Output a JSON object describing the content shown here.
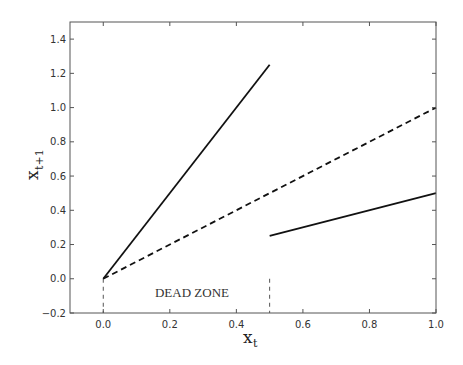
{
  "chart_data": {
    "type": "line",
    "title": "",
    "xlabel": "x_t",
    "ylabel": "x_{t+1}",
    "xlim": [
      -0.1,
      1.0
    ],
    "ylim": [
      -0.2,
      1.5
    ],
    "grid": false,
    "legend": null,
    "xticks": [
      0.0,
      0.2,
      0.4,
      0.6,
      0.8,
      1.0
    ],
    "xtick_labels": [
      "0.0",
      "0.2",
      "0.4",
      "0.6",
      "0.8",
      "1.0"
    ],
    "yticks": [
      -0.2,
      0.0,
      0.2,
      0.4,
      0.6,
      0.8,
      1.0,
      1.2,
      1.4
    ],
    "ytick_labels": [
      "−0.2",
      "0.0",
      "0.2",
      "0.4",
      "0.6",
      "0.8",
      "1.0",
      "1.2",
      "1.4"
    ],
    "series": [
      {
        "name": "map-upper-branch",
        "style": "solid",
        "color": "#111111",
        "x": [
          0.0,
          0.5
        ],
        "y": [
          0.0,
          1.25
        ]
      },
      {
        "name": "identity-line",
        "style": "dashed",
        "color": "#111111",
        "x": [
          0.0,
          1.0
        ],
        "y": [
          0.0,
          1.0
        ]
      },
      {
        "name": "map-lower-branch",
        "style": "solid",
        "color": "#111111",
        "x": [
          0.5,
          1.0
        ],
        "y": [
          0.25,
          0.5
        ]
      }
    ],
    "annotations": [
      {
        "text": "DEAD ZONE",
        "x": 0.25,
        "y": -0.1
      }
    ],
    "markers": [
      {
        "name": "dead-zone-left-boundary",
        "style": "dashed-vertical",
        "x": 0.0,
        "y_from": -0.2,
        "y_to": 0.0
      },
      {
        "name": "dead-zone-right-boundary",
        "style": "dashed-vertical",
        "x": 0.5,
        "y_from": -0.2,
        "y_to": 0.0
      }
    ]
  },
  "labels": {
    "xlabel_main": "x",
    "xlabel_sub": "t",
    "ylabel_main": "x",
    "ylabel_sub": "t+1",
    "annotation": "DEAD ZONE"
  }
}
